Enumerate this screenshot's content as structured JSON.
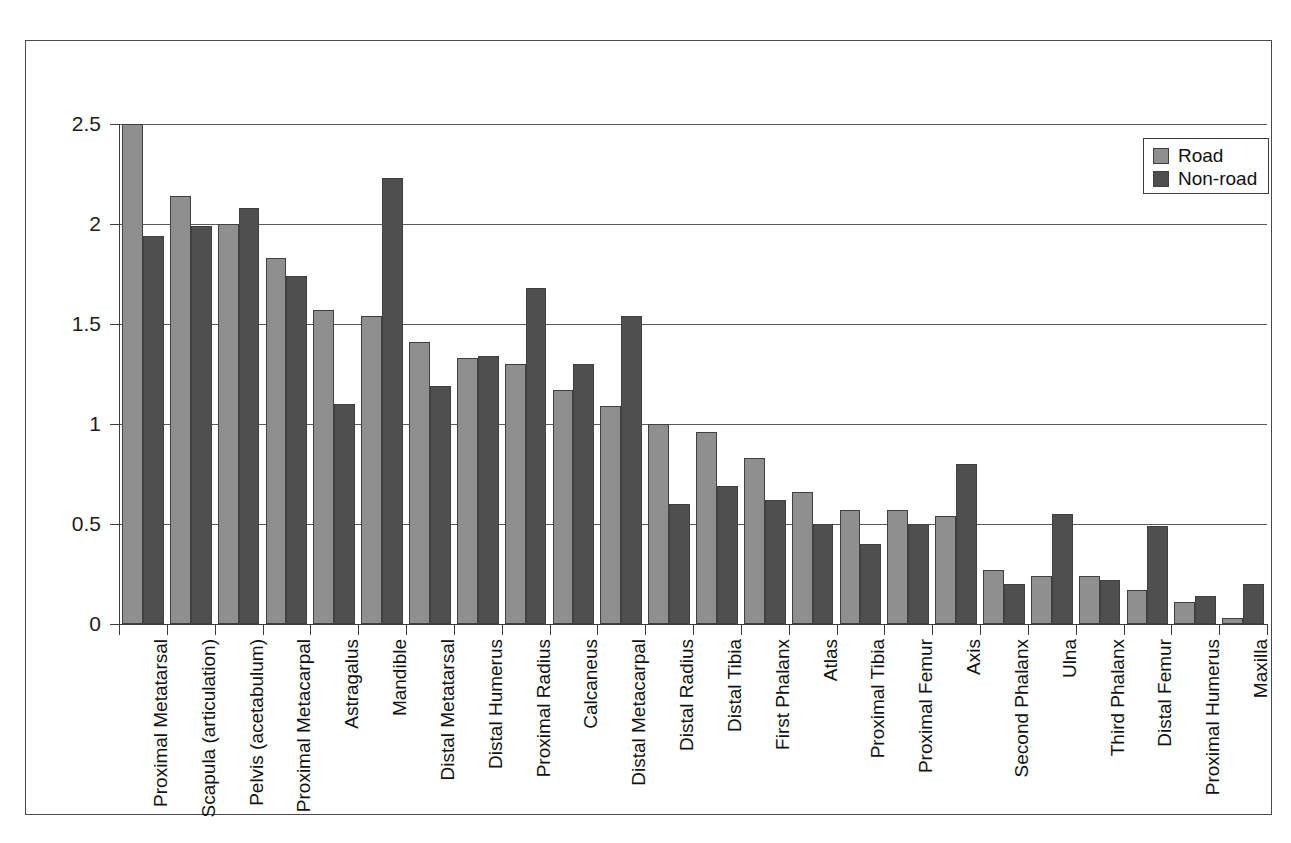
{
  "chart_data": {
    "type": "bar",
    "title": "",
    "subtitle": "",
    "xlabel": "",
    "ylabel": "",
    "ylim": [
      0,
      2.5
    ],
    "ytick_labels": [
      "0",
      "0.5",
      "1",
      "1.5",
      "2",
      "2.5"
    ],
    "ytick_values": [
      0,
      0.5,
      1,
      1.5,
      2,
      2.5
    ],
    "grid": true,
    "grid_axis": "y",
    "legend_position": "top-right",
    "legend": [
      "Road",
      "Non-road"
    ],
    "categories": [
      "Proximal Metatarsal",
      "Scapula (articulation)",
      "Pelvis (acetabulum)",
      "Proximal Metacarpal",
      "Astragalus",
      "Mandible",
      "Distal Metatarsal",
      "Distal Humerus",
      "Proximal Radius",
      "Calcaneus",
      "Distal Metacarpal",
      "Distal Radius",
      "Distal Tibia",
      "First Phalanx",
      "Atlas",
      "Proximal Tibia",
      "Proximal Femur",
      "Axis",
      "Second Phalanx",
      "Ulna",
      "Third Phalanx",
      "Distal Femur",
      "Proximal Humerus",
      "Maxilla"
    ],
    "series": [
      {
        "name": "Road",
        "color": "#8f8f8f",
        "values": [
          2.5,
          2.14,
          2.0,
          1.83,
          1.57,
          1.54,
          1.41,
          1.33,
          1.3,
          1.17,
          1.09,
          1.0,
          0.96,
          0.83,
          0.66,
          0.57,
          0.57,
          0.54,
          0.27,
          0.24,
          0.24,
          0.17,
          0.11,
          0.03
        ]
      },
      {
        "name": "Non-road",
        "color": "#4f4f4f",
        "values": [
          1.94,
          1.99,
          2.08,
          1.74,
          1.1,
          2.23,
          1.19,
          1.34,
          1.68,
          1.3,
          1.54,
          0.6,
          0.69,
          0.62,
          0.5,
          0.4,
          0.5,
          0.8,
          0.2,
          0.55,
          0.22,
          0.49,
          0.14,
          0.2
        ]
      }
    ]
  },
  "legend": {
    "road_label": "Road",
    "nonroad_label": "Non-road"
  }
}
